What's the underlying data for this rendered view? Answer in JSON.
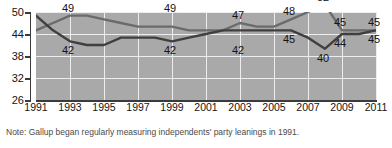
{
  "note": "Note: Gallup began regularly measuring independents' party leanings in 1991.",
  "colors": {
    "panel_background": "#a9a9a9",
    "gridline": "#ededed",
    "axis": "#3b3b3b",
    "line_democratic": "#6b6b6b",
    "line_republican": "#3f3f3f",
    "label_text": "#141414",
    "note_text": "#4a4a4a",
    "page_background": "#ffffff"
  },
  "axes": {
    "y_ticks": [
      "50",
      "44",
      "38",
      "32",
      "26"
    ],
    "y_tick_values": [
      50,
      44,
      38,
      32,
      26
    ],
    "x_ticks": [
      "1991",
      "1993",
      "1995",
      "1997",
      "1999",
      "2001",
      "2003",
      "2005",
      "2007",
      "2009",
      "2011"
    ],
    "x_tick_values": [
      1991,
      1993,
      1995,
      1997,
      1999,
      2001,
      2003,
      2005,
      2007,
      2009,
      2011
    ]
  },
  "point_labels": [
    {
      "text": "49",
      "x": 1993,
      "value": 49,
      "place": "above"
    },
    {
      "text": "49",
      "x": 1999,
      "value": 49,
      "place": "above"
    },
    {
      "text": "47",
      "x": 2003,
      "value": 47,
      "place": "above"
    },
    {
      "text": "48",
      "x": 2006,
      "value": 48,
      "place": "above"
    },
    {
      "text": "52",
      "x": 2008,
      "value": 52,
      "place": "above"
    },
    {
      "text": "45",
      "x": 2009,
      "value": 45,
      "place": "above"
    },
    {
      "text": "45",
      "x": 2011,
      "value": 45,
      "place": "above"
    },
    {
      "text": "42",
      "x": 1993,
      "value": 42,
      "place": "below"
    },
    {
      "text": "42",
      "x": 1999,
      "value": 42,
      "place": "below"
    },
    {
      "text": "42",
      "x": 2003,
      "value": 42,
      "place": "below"
    },
    {
      "text": "45",
      "x": 2006,
      "value": 45,
      "place": "below"
    },
    {
      "text": "40",
      "x": 2008,
      "value": 40,
      "place": "below"
    },
    {
      "text": "44",
      "x": 2009,
      "value": 44,
      "place": "below"
    },
    {
      "text": "45",
      "x": 2011,
      "value": 45,
      "place": "below"
    }
  ],
  "chart_data": {
    "type": "line",
    "title": "",
    "subtitle": "",
    "xlabel": "",
    "ylabel": "",
    "xlim": [
      1991,
      2011
    ],
    "ylim": [
      26,
      50
    ],
    "grid": true,
    "legend": "none",
    "x": [
      1991,
      1992,
      1993,
      1994,
      1995,
      1996,
      1997,
      1998,
      1999,
      2000,
      2001,
      2002,
      2003,
      2004,
      2005,
      2006,
      2007,
      2008,
      2009,
      2010,
      2011
    ],
    "series": [
      {
        "name": "Democratic/lean Democratic",
        "values": [
          45,
          47,
          49,
          49,
          48,
          47,
          46,
          46,
          46,
          45,
          45,
          45,
          47,
          46,
          46,
          48,
          50,
          52,
          45,
          45,
          45
        ]
      },
      {
        "name": "Republican/lean Republican",
        "values": [
          49,
          45,
          42,
          41,
          41,
          43,
          43,
          43,
          42,
          43,
          44,
          45,
          45,
          45,
          45,
          45,
          43,
          40,
          44,
          44,
          45
        ]
      }
    ],
    "annotations": [
      {
        "x": 1993,
        "y": 49,
        "text": "49"
      },
      {
        "x": 1999,
        "y": 46,
        "text": "49"
      },
      {
        "x": 2003,
        "y": 47,
        "text": "47"
      },
      {
        "x": 2006,
        "y": 48,
        "text": "48"
      },
      {
        "x": 2008,
        "y": 52,
        "text": "52"
      },
      {
        "x": 2009,
        "y": 45,
        "text": "45"
      },
      {
        "x": 2011,
        "y": 45,
        "text": "45"
      },
      {
        "x": 1993,
        "y": 42,
        "text": "42"
      },
      {
        "x": 1999,
        "y": 42,
        "text": "42"
      },
      {
        "x": 2003,
        "y": 45,
        "text": "42"
      },
      {
        "x": 2006,
        "y": 45,
        "text": "45"
      },
      {
        "x": 2008,
        "y": 40,
        "text": "40"
      },
      {
        "x": 2009,
        "y": 44,
        "text": "44"
      },
      {
        "x": 2011,
        "y": 45,
        "text": "45"
      }
    ]
  }
}
